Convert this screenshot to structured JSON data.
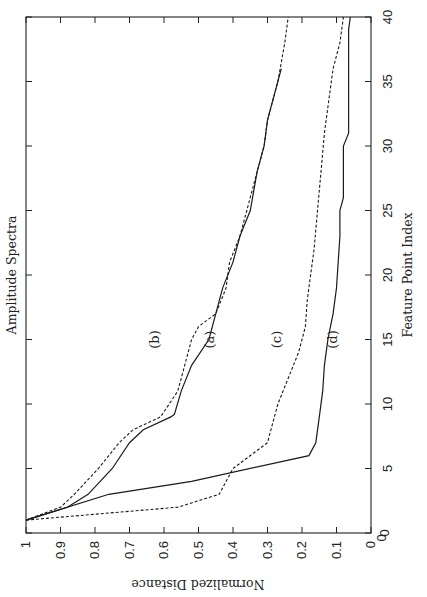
{
  "chart_data": {
    "type": "line",
    "title": "Amplitude Spectra",
    "xlabel": "Feature Point Index",
    "ylabel": "Normalized Distance",
    "xlim": [
      0,
      40
    ],
    "ylim": [
      0,
      1
    ],
    "xticks": [
      0,
      5,
      10,
      15,
      20,
      25,
      30,
      35,
      40
    ],
    "yticks": [
      0,
      0.1,
      0.2,
      0.3,
      0.4,
      0.5,
      0.6,
      0.7,
      0.8,
      0.9,
      1
    ],
    "ytick_labels": [
      "0",
      "0.1",
      "0.2",
      "0.3",
      "0.4",
      "0.5",
      "0.6",
      "0.7",
      "0.8",
      "0.9",
      "1"
    ],
    "grid": false,
    "orientation": "rotated 90 degrees counter-clockwise on page",
    "series": [
      {
        "name": "(a)",
        "style": "solid",
        "x": [
          1,
          2,
          3,
          5,
          7,
          8,
          9,
          9.2,
          11,
          13,
          15,
          17,
          19,
          21,
          23,
          25,
          28,
          30,
          32,
          34,
          36
        ],
        "y": [
          1.0,
          0.88,
          0.82,
          0.75,
          0.7,
          0.66,
          0.58,
          0.57,
          0.55,
          0.52,
          0.47,
          0.45,
          0.43,
          0.4,
          0.38,
          0.35,
          0.33,
          0.31,
          0.3,
          0.28,
          0.26
        ]
      },
      {
        "name": "(b)",
        "style": "dashed",
        "x": [
          1,
          2,
          3,
          5,
          7,
          8,
          9,
          11,
          13,
          15,
          16,
          17,
          19,
          21,
          23,
          25,
          28,
          30,
          32,
          35,
          38,
          40
        ],
        "y": [
          1.0,
          0.9,
          0.86,
          0.79,
          0.73,
          0.69,
          0.61,
          0.56,
          0.54,
          0.52,
          0.5,
          0.45,
          0.42,
          0.41,
          0.38,
          0.36,
          0.33,
          0.31,
          0.3,
          0.27,
          0.25,
          0.24
        ]
      },
      {
        "name": "(c)",
        "style": "dashed",
        "x": [
          1,
          2,
          3,
          5,
          7,
          8,
          10,
          12,
          14,
          16,
          18,
          20,
          22,
          25,
          28,
          31,
          34,
          36,
          38,
          40
        ],
        "y": [
          1.0,
          0.56,
          0.44,
          0.4,
          0.3,
          0.29,
          0.27,
          0.24,
          0.21,
          0.19,
          0.185,
          0.175,
          0.165,
          0.155,
          0.145,
          0.135,
          0.12,
          0.11,
          0.09,
          0.08
        ]
      },
      {
        "name": "(d)",
        "style": "solid",
        "x": [
          1,
          3,
          4,
          6,
          7,
          9,
          11,
          13,
          15,
          17,
          19,
          21,
          23,
          25,
          26,
          30,
          31,
          39,
          40
        ],
        "y": [
          1.0,
          0.76,
          0.52,
          0.18,
          0.16,
          0.15,
          0.14,
          0.135,
          0.125,
          0.11,
          0.1,
          0.095,
          0.09,
          0.09,
          0.08,
          0.08,
          0.065,
          0.065,
          0.06
        ]
      }
    ],
    "curve_labels": [
      {
        "text": "(b)",
        "x": 15,
        "y": 0.615
      },
      {
        "text": "(a)",
        "x": 15,
        "y": 0.455
      },
      {
        "text": "(c)",
        "x": 15,
        "y": 0.26
      },
      {
        "text": "(d)",
        "x": 15,
        "y": 0.1
      }
    ]
  },
  "page": {
    "caption_fragment": "Fig. 4  Plot of key-point..."
  }
}
